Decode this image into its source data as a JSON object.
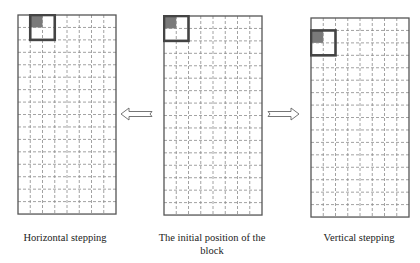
{
  "grid": {
    "cols": 8,
    "rows": 16,
    "cell_w": 12.25,
    "cell_h": 12.44,
    "outline_color": "#555555",
    "dash_color": "#8a8a8a",
    "block_border_color": "#444444",
    "shaded_cell_color": "#7a7a7a"
  },
  "panels": [
    {
      "id": "horizontal",
      "x": 17,
      "y": 14,
      "block_col": 1,
      "block_row": 0,
      "caption": "Horizontal stepping",
      "caption_x": 0,
      "caption_y": 231,
      "caption_w": 130
    },
    {
      "id": "initial",
      "x": 163,
      "y": 15,
      "block_col": 0,
      "block_row": 0,
      "caption": "The initial position of the block",
      "caption_x": 148,
      "caption_y": 231,
      "caption_w": 128
    },
    {
      "id": "vertical",
      "x": 310,
      "y": 17,
      "block_col": 0,
      "block_row": 1,
      "caption": "Vertical stepping",
      "caption_x": 294,
      "caption_y": 231,
      "caption_w": 130
    }
  ],
  "arrows": [
    {
      "id": "to-horizontal",
      "direction": "left",
      "x": 120,
      "y": 107
    },
    {
      "id": "to-vertical",
      "direction": "right",
      "x": 266,
      "y": 107
    }
  ],
  "captions": {
    "horizontal": "Horizontal stepping",
    "initial": "The initial position of the block",
    "vertical": "Vertical stepping"
  }
}
